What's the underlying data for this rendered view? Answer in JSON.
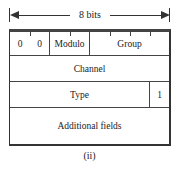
{
  "diagram": {
    "width_label": "8 bits",
    "rows": [
      {
        "name": "header-row",
        "fields": [
          {
            "label": "0",
            "bits": 1
          },
          {
            "label": "0",
            "bits": 1
          },
          {
            "label": "Modulo",
            "bits": 2
          },
          {
            "label": "Group",
            "bits": 4
          }
        ]
      },
      {
        "name": "channel-row",
        "fields": [
          {
            "label": "Channel",
            "bits": 8
          }
        ]
      },
      {
        "name": "type-row",
        "fields": [
          {
            "label": "Type",
            "bits": 7
          },
          {
            "label": "1",
            "bits": 1
          }
        ]
      },
      {
        "name": "additional-row",
        "fields": [
          {
            "label": "Additional fields",
            "bits": 8
          }
        ]
      }
    ],
    "caption": "(ii)"
  }
}
